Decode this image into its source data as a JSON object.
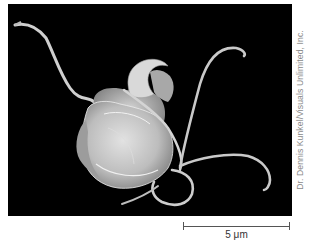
{
  "figure": {
    "background_color": "#000000",
    "specimen_color": "#c8c8c8"
  },
  "credit": {
    "text": "Dr. Dennis Kunkel/Visuals Unlimited, Inc."
  },
  "scale_bar": {
    "label": "5 μm"
  }
}
